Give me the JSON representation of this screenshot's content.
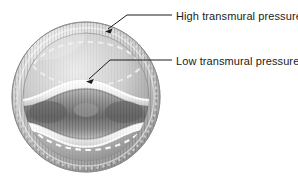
{
  "figure": {
    "background_color": "#ffffff",
    "vessel": {
      "outline_name": "vessel-outer-circle",
      "center_x": 86,
      "center_y": 97,
      "radius_x": 74,
      "radius_y": 75,
      "rim_color_light": "#e8e8e8",
      "rim_color_mid": "#b6b6b6",
      "rim_color_dark": "#8c8c8c",
      "upper_chamber_color": "#3a3a3a",
      "lower_chamber_color": "#e2e2e2",
      "lumen_highlight_color": "#fdfdfd",
      "dashed_guide_color": "#f2f2f2"
    }
  },
  "annotations": [
    {
      "id": "high-transmural-pressure",
      "label": "High transmural pressure",
      "text_x": 176,
      "text_y": 20,
      "line_from_x": 172,
      "line_from_y": 15,
      "line_bend_x": 127,
      "line_bend_y": 15,
      "arrow_tip_x": 106,
      "arrow_tip_y": 31,
      "stroke_color": "#1c1c1c"
    },
    {
      "id": "low-transmural-pressure",
      "label": "Low transmural pressure",
      "text_x": 176,
      "text_y": 65,
      "line_from_x": 172,
      "line_from_y": 60,
      "line_bend_x": 110,
      "line_bend_y": 60,
      "arrow_tip_x": 87,
      "arrow_tip_y": 81,
      "stroke_color": "#1c1c1c"
    }
  ]
}
